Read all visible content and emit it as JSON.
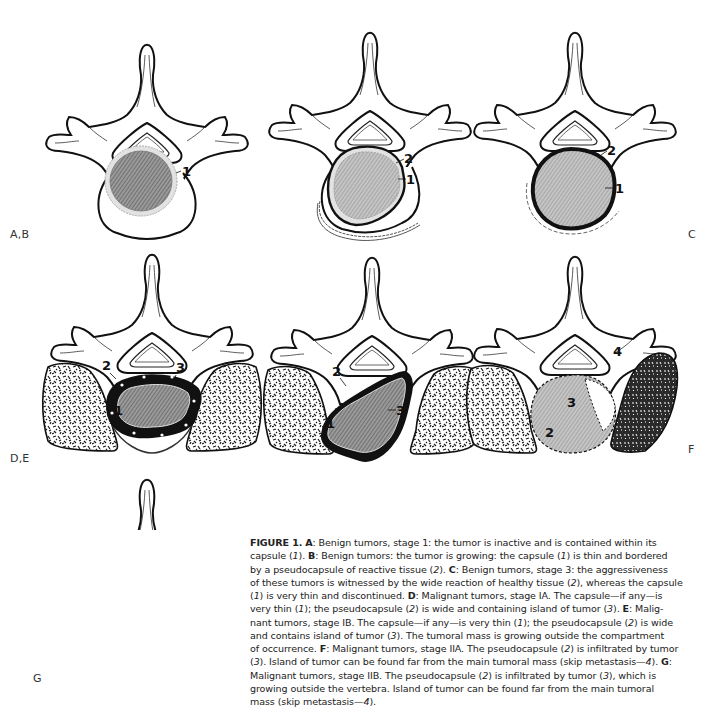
{
  "figure": {
    "panel_labels": {
      "ab": "A,B",
      "c": "C",
      "de": "D,E",
      "f": "F",
      "g": "G"
    },
    "panels": [
      {
        "id": "A",
        "labels": [
          "1"
        ]
      },
      {
        "id": "B",
        "labels": [
          "2",
          "1"
        ]
      },
      {
        "id": "C",
        "labels": [
          "2",
          "1"
        ]
      },
      {
        "id": "D",
        "labels": [
          "2",
          "3",
          "1"
        ]
      },
      {
        "id": "E",
        "labels": [
          "2",
          "1",
          "3"
        ]
      },
      {
        "id": "F",
        "labels": [
          "4",
          "3",
          "2"
        ]
      },
      {
        "id": "G",
        "labels": [
          "4",
          "2",
          "3"
        ]
      }
    ]
  },
  "caption": {
    "figure_number": "FIGURE 1.",
    "lines": [
      "FIGURE 1. A: Benign tumors, stage 1: the tumor is inactive and is contained within its",
      "capsule (1). B: Benign tumors: the tumor is growing: the capsule (1) is thin and bordered",
      "by a pseudocapsule of reactive tissue (2). C: Benign tumors, stage 3: the aggressiveness",
      "of these tumors is witnessed by the wide reaction of healthy tissue (2), whereas the capsule",
      "(1) is very thin and discontinued. D: Malignant tumors, stage IA. The capsule—if any—is",
      "very thin (1); the pseudocapsule (2) is wide and containing island of tumor (3). E: Malig-",
      "nant tumors, stage IB. The capsule—if any—is very thin (1); the pseudocapsule (2) is wide",
      "and contains island of tumor (3). The tumoral mass is growing outside the compartment",
      "of occurrence. F: Malignant tumors, stage IIA. The pseudocapsule (2) is infiltrated by tumor",
      "(3). Island of tumor can be found far from the main tumoral mass (skip metastasis—4). G:",
      "Malignant tumors, stage IIB. The pseudocapsule (2) is infiltrated by tumor (3), which is",
      "growing outside the vertebra. Island of tumor can be found far from the main tumoral",
      "mass (skip metastasis—4)."
    ]
  }
}
